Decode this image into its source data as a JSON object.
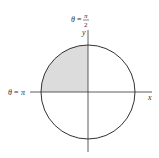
{
  "figure": {
    "axes": {
      "x_label": "x",
      "y_label": "y"
    },
    "annotations": {
      "top": {
        "lhs": "θ",
        "eq": "=",
        "numerator": "π",
        "denominator": "2"
      },
      "left": {
        "lhs": "θ",
        "eq": "=",
        "value": "π"
      }
    },
    "shaded_region": "quadrant II",
    "colors": {
      "line": "#333333",
      "shade": "#dcdcdc",
      "background": "#ffffff"
    }
  }
}
